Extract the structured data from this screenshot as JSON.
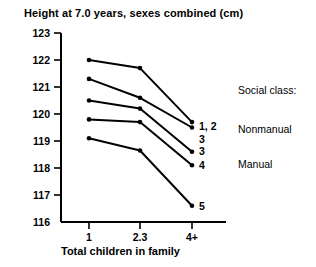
{
  "chart_data": {
    "type": "line",
    "title": "Height at 7.0 years, sexes combined (cm)",
    "xlabel": "Total children in family",
    "ylabel": "",
    "categories": [
      "1",
      "2.3",
      "4+"
    ],
    "ylim": [
      116,
      123
    ],
    "yticks": [
      "116",
      "117",
      "118",
      "119",
      "120",
      "121",
      "122",
      "123"
    ],
    "grid": false,
    "legend_position": "right",
    "series": [
      {
        "name": "1, 2",
        "label": "1, 2",
        "values": [
          122.0,
          121.7,
          119.7
        ]
      },
      {
        "name": "3 Nonmanual",
        "label": "3",
        "values": [
          121.3,
          120.6,
          119.5
        ]
      },
      {
        "name": "3 Manual",
        "label": "3",
        "values": [
          120.5,
          120.2,
          118.6
        ]
      },
      {
        "name": "4",
        "label": "4",
        "values": [
          119.8,
          119.7,
          118.1
        ]
      },
      {
        "name": "5",
        "label": "5",
        "values": [
          119.1,
          118.65,
          116.6
        ]
      }
    ],
    "annotations": [
      {
        "text": "Social class:",
        "role": "legend-heading"
      },
      {
        "text": "Nonmanual",
        "role": "legend-group"
      },
      {
        "text": "Manual",
        "role": "legend-group"
      }
    ]
  },
  "legend": {
    "heading": "Social class:",
    "groups": [
      "Nonmanual",
      "Manual"
    ]
  },
  "colors": {
    "line": "#000000",
    "axis": "#000000",
    "background": "#ffffff"
  }
}
